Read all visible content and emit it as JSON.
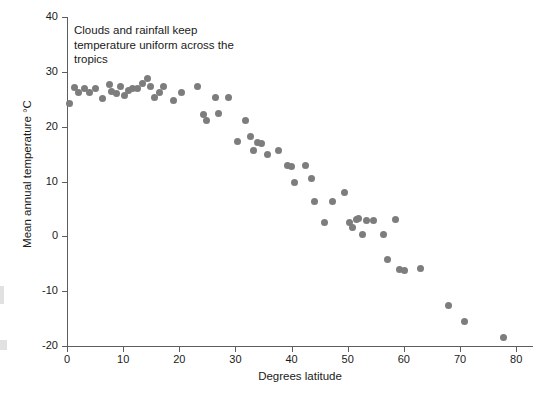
{
  "figure": {
    "annotation": "Clouds and rainfall keep temperature uniform across the tropics",
    "marker_color": "#7d7d7d",
    "axis_color": "#5d5d5d",
    "background_color": "#ffffff"
  },
  "chart_data": {
    "type": "scatter",
    "title": "",
    "xlabel": "Degrees latitude",
    "ylabel": "Mean annual temperature °C",
    "xlim": [
      0,
      83
    ],
    "ylim": [
      -20,
      40
    ],
    "xticks": [
      0,
      10,
      20,
      30,
      40,
      50,
      60,
      70,
      80
    ],
    "xtick_labels": [
      "0",
      "10",
      "20",
      "30",
      "40",
      "50",
      "60",
      "70",
      "80"
    ],
    "yticks": [
      -20,
      -10,
      0,
      10,
      20,
      30,
      40
    ],
    "ytick_labels": [
      "-20",
      "-10",
      "0",
      "10",
      "20",
      "30",
      "40"
    ],
    "grid": false,
    "legend": null,
    "annotations": [
      {
        "text": "Clouds and rainfall keep temperature uniform across the tropics",
        "x": 1.5,
        "y": 38
      }
    ],
    "series": [
      {
        "name": "Mean annual temperature vs latitude",
        "color": "#7d7d7d",
        "points": [
          [
            0.5,
            24.3
          ],
          [
            1.3,
            27.1
          ],
          [
            2.0,
            26.2
          ],
          [
            3.2,
            27.0
          ],
          [
            4.0,
            26.3
          ],
          [
            5.0,
            27.0
          ],
          [
            6.3,
            25.1
          ],
          [
            7.6,
            27.6
          ],
          [
            8.0,
            26.4
          ],
          [
            8.8,
            26.0
          ],
          [
            9.5,
            27.4
          ],
          [
            10.2,
            25.6
          ],
          [
            10.9,
            26.6
          ],
          [
            11.6,
            27.0
          ],
          [
            12.5,
            26.9
          ],
          [
            13.4,
            27.9
          ],
          [
            14.3,
            28.8
          ],
          [
            14.9,
            27.3
          ],
          [
            15.6,
            25.3
          ],
          [
            16.4,
            26.2
          ],
          [
            17.2,
            27.3
          ],
          [
            19.0,
            24.7
          ],
          [
            20.4,
            26.3
          ],
          [
            23.2,
            27.3
          ],
          [
            24.3,
            22.3
          ],
          [
            24.9,
            21.1
          ],
          [
            26.5,
            25.4
          ],
          [
            27.0,
            22.4
          ],
          [
            28.8,
            25.4
          ],
          [
            30.3,
            17.3
          ],
          [
            31.8,
            21.1
          ],
          [
            32.7,
            18.2
          ],
          [
            33.3,
            15.6
          ],
          [
            33.9,
            17.1
          ],
          [
            34.7,
            16.9
          ],
          [
            35.8,
            15.0
          ],
          [
            37.6,
            15.6
          ],
          [
            39.2,
            12.9
          ],
          [
            39.9,
            12.7
          ],
          [
            40.6,
            9.8
          ],
          [
            42.5,
            13.0
          ],
          [
            43.6,
            10.6
          ],
          [
            44.1,
            6.4
          ],
          [
            45.9,
            2.5
          ],
          [
            47.3,
            6.3
          ],
          [
            49.5,
            8.0
          ],
          [
            50.3,
            2.5
          ],
          [
            50.9,
            1.6
          ],
          [
            51.5,
            3.0
          ],
          [
            51.9,
            3.2
          ],
          [
            52.6,
            0.3
          ],
          [
            53.3,
            2.9
          ],
          [
            54.6,
            2.8
          ],
          [
            56.3,
            0.4
          ],
          [
            57.0,
            -4.2
          ],
          [
            58.5,
            3.1
          ],
          [
            59.2,
            -6.1
          ],
          [
            60.1,
            -6.2
          ],
          [
            62.9,
            -5.9
          ],
          [
            68.0,
            -12.6
          ],
          [
            70.8,
            -15.6
          ],
          [
            77.7,
            -18.4
          ]
        ]
      }
    ]
  }
}
